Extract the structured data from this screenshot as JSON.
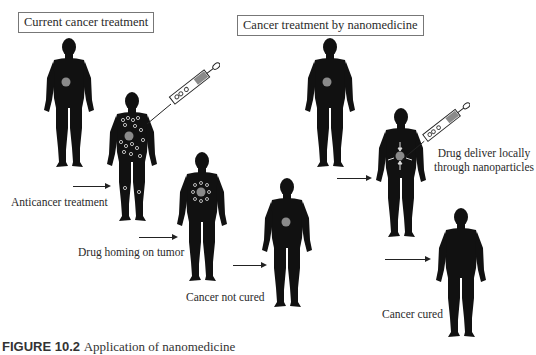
{
  "panels": {
    "current": {
      "title": "Current cancer treatment",
      "steps": [
        {
          "label": "Anticancer treatment"
        },
        {
          "label": "Drug homing on tumor"
        },
        {
          "label": "Cancer not cured"
        }
      ]
    },
    "nano": {
      "title": "Cancer treatment by nanomedicine",
      "steps": [
        {
          "label_line1": "Drug deliver locally",
          "label_line2": "through nanoparticles"
        },
        {
          "label": "Cancer cured"
        }
      ]
    }
  },
  "caption": {
    "number": "FIGURE 10.2",
    "text": "Application of nanomedicine"
  },
  "colors": {
    "silhouette": "#111111",
    "tumor": "#8a8a8a",
    "box_border": "#777777"
  }
}
